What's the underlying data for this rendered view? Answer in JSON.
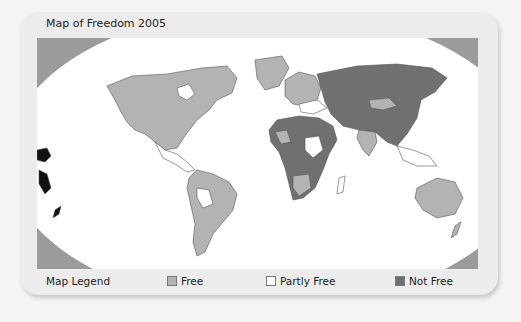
{
  "title": "Map of Freedom 2005",
  "legend": {
    "heading": "Map Legend",
    "items": [
      {
        "label": "Free",
        "color": "#b3b3b3"
      },
      {
        "label": "Partly Free",
        "color": "#ffffff"
      },
      {
        "label": "Not Free",
        "color": "#707070"
      }
    ]
  },
  "colors": {
    "background": "#9b9b9b",
    "ocean": "#ffffff",
    "free": "#b3b3b3",
    "partly_free": "#ffffff",
    "not_free": "#707070"
  }
}
